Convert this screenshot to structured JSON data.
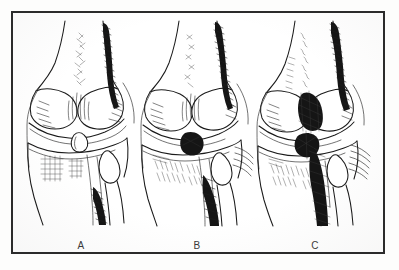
{
  "figure": {
    "type": "anatomical-line-illustration",
    "panel_count": 3,
    "frame_color": "#2b2b2b",
    "ink_color": "#1b1b1b",
    "paper_color": "#ffffff",
    "panels": [
      {
        "label": "A",
        "caption_position": "below-drawing",
        "depicts": "knee joint anteroposterior view, stage A"
      },
      {
        "label": "B",
        "caption_position": "below-drawing",
        "depicts": "knee joint anteroposterior view, stage B"
      },
      {
        "label": "C",
        "caption_position": "below-drawing",
        "depicts": "knee joint anteroposterior view, stage C"
      }
    ]
  }
}
